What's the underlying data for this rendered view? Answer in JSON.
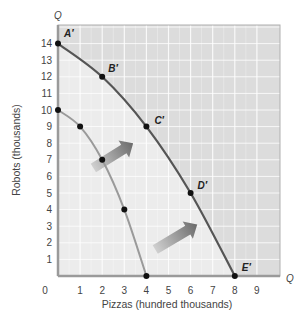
{
  "chart_data": {
    "type": "line",
    "title": "",
    "xlabel": "Pizzas (hundred thousands)",
    "ylabel": "Robots (thousands)",
    "x_axis_end_label": "Q",
    "y_axis_end_label": "Q",
    "origin_label": "0",
    "xlim": [
      0,
      10
    ],
    "ylim": [
      0,
      15
    ],
    "x_ticks": [
      "1",
      "2",
      "3",
      "4",
      "5",
      "6",
      "7",
      "8",
      "9"
    ],
    "y_ticks": [
      "1",
      "2",
      "3",
      "4",
      "5",
      "6",
      "7",
      "8",
      "9",
      "10",
      "11",
      "12",
      "13",
      "14"
    ],
    "grid": true,
    "series": [
      {
        "name": "Original production possibilities curve",
        "color": "#9a9a9a",
        "points": [
          {
            "x": 0,
            "y": 10,
            "label": ""
          },
          {
            "x": 1,
            "y": 9,
            "label": ""
          },
          {
            "x": 2,
            "y": 7,
            "label": ""
          },
          {
            "x": 3,
            "y": 4,
            "label": ""
          },
          {
            "x": 4,
            "y": 0,
            "label": ""
          }
        ]
      },
      {
        "name": "Shifted production possibilities curve",
        "color": "#555555",
        "points": [
          {
            "x": 0,
            "y": 14,
            "label": "A′"
          },
          {
            "x": 2,
            "y": 12,
            "label": "B′"
          },
          {
            "x": 4,
            "y": 9,
            "label": "C′"
          },
          {
            "x": 6,
            "y": 5,
            "label": "D′"
          },
          {
            "x": 8,
            "y": 0,
            "label": "E′"
          }
        ]
      }
    ],
    "annotations": [
      {
        "type": "arrow",
        "direction": "outward shift",
        "from": [
          1.6,
          6.5
        ],
        "to": [
          3.4,
          8.0
        ]
      },
      {
        "type": "arrow",
        "direction": "outward shift",
        "from": [
          4.4,
          1.6
        ],
        "to": [
          6.3,
          3.1
        ]
      }
    ],
    "colors": {
      "inside_region": "#ececec",
      "outside_region": "#dcdcdc",
      "axis": "#9a9a9a",
      "point": "#111111"
    }
  }
}
